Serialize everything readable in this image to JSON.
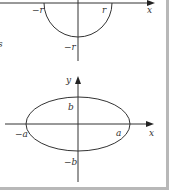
{
  "figure_top": {
    "type": "circle",
    "labels": {
      "neg_r_x": "−r",
      "pos_r_x": "r",
      "x_axis": "x",
      "neg_r_y": "−r",
      "margin_fragment": "s"
    }
  },
  "figure_bottom": {
    "type": "ellipse",
    "labels": {
      "y_axis": "y",
      "b": "b",
      "neg_a": "−a",
      "a": "a",
      "x_axis": "x",
      "neg_b": "−b"
    }
  },
  "colors": {
    "stroke": "#333333",
    "frame": "#b8b8b8"
  }
}
